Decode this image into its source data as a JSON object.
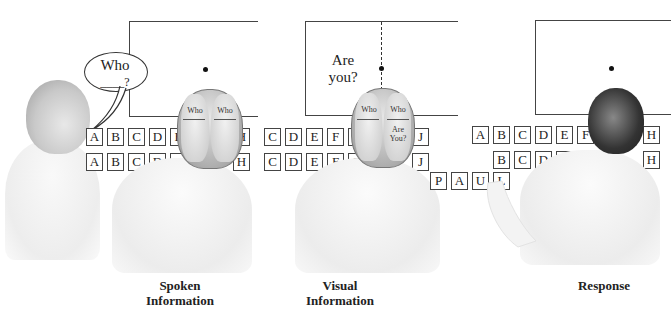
{
  "figure": {
    "panels": [
      {
        "id": "spoken",
        "caption_line1": "Spoken",
        "caption_line2": "Information",
        "speech_bubble": {
          "line1": "Who",
          "line2": "____?"
        },
        "brain_left_text": "Who",
        "brain_right_text": "Who",
        "brain_left_blank": "____?",
        "brain_right_blank": "____?",
        "row1_letters": [
          "A",
          "B",
          "C",
          "D",
          "E",
          "H"
        ],
        "row2_letters": [
          "A",
          "B",
          "C",
          "D",
          "E",
          "H"
        ]
      },
      {
        "id": "visual",
        "caption_line1": "Visual",
        "caption_line2": "Information",
        "screen_text_line1": "Are",
        "screen_text_line2": "you?",
        "brain_left_text": "Who",
        "brain_right_text": "Who",
        "brain_left_blank": "____?",
        "brain_right_blank": "____?",
        "brain_right_extra_line1": "Are",
        "brain_right_extra_line2": "You?",
        "row1_letters": [
          "C",
          "D",
          "E",
          "F",
          "G",
          "J"
        ],
        "row2_letters": [
          "C",
          "D",
          "E",
          "F",
          "G",
          "J"
        ]
      },
      {
        "id": "response",
        "caption_line1": "Response",
        "row1_letters": [
          "A",
          "B",
          "C",
          "D",
          "E",
          "F",
          "H"
        ],
        "row2_letters": [
          "B",
          "C",
          "D",
          "E",
          "F",
          "H"
        ],
        "spelled_letters": [
          "P",
          "A",
          "U",
          "L"
        ]
      }
    ]
  }
}
